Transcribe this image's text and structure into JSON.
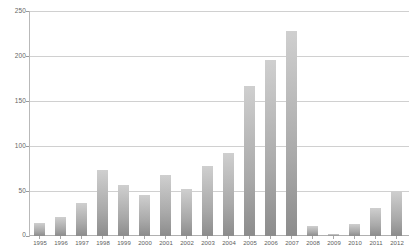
{
  "chart_data": {
    "type": "bar",
    "title": "",
    "subtitle": "",
    "xlabel": "",
    "ylabel": "",
    "categories": [
      "1995",
      "1996",
      "1997",
      "1998",
      "1999",
      "2000",
      "2001",
      "2002",
      "2003",
      "2004",
      "2005",
      "2006",
      "2007",
      "2008",
      "2009",
      "2010",
      "2011",
      "2012"
    ],
    "values": [
      15,
      21,
      37,
      74,
      57,
      46,
      68,
      52,
      78,
      93,
      167,
      197,
      229,
      11,
      2,
      13,
      31,
      50
    ],
    "series": [
      {
        "name": "",
        "values": [
          15,
          21,
          37,
          74,
          57,
          46,
          68,
          52,
          78,
          93,
          167,
          197,
          229,
          11,
          2,
          13,
          31,
          50
        ]
      }
    ],
    "ylim": [
      0,
      250
    ],
    "ytick_labels": [
      "0",
      "50",
      "100",
      "150",
      "200",
      "250"
    ],
    "ytick_values": [
      0,
      50,
      100,
      150,
      200,
      250
    ],
    "grid": true,
    "grid_axis": "y",
    "legend": false,
    "legend_position": "none",
    "annotations": [],
    "colors": {
      "bar_top": "#cfcfcf",
      "bar_bottom": "#8c8c8c",
      "gridline": "#d0d0d0",
      "axis": "#b9b9b9",
      "tick_label": "#5c5c5c",
      "background": "#ffffff"
    }
  }
}
